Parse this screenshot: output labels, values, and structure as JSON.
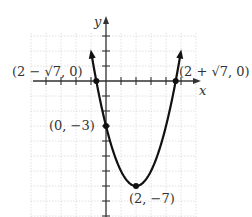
{
  "chart_data": {
    "type": "line",
    "title": "",
    "function": "y = x^2 - 4x - 3",
    "xlabel": "x",
    "ylabel": "y",
    "xlim": [
      -5,
      6
    ],
    "ylim": [
      -9,
      3
    ],
    "grid": true,
    "tick_spacing": 1,
    "series": [
      {
        "name": "parabola",
        "x": [
          -0.9,
          -0.646,
          0,
          1,
          2,
          3,
          4,
          4.646,
          4.9
        ],
        "values": [
          1.41,
          0,
          -3,
          -6,
          -7,
          -6,
          -3,
          0,
          1.41
        ]
      }
    ],
    "points": [
      {
        "label": "(2 − √7, 0)",
        "x": -0.646,
        "y": 0
      },
      {
        "label": "(2 + √7, 0)",
        "x": 4.646,
        "y": 0
      },
      {
        "label": "(0, −3)",
        "x": 0,
        "y": -3
      },
      {
        "label": "(2, −7)",
        "x": 2,
        "y": -7
      }
    ]
  },
  "labels": {
    "x_axis": "x",
    "y_axis": "y",
    "root_left": "(2 − √7, 0)",
    "root_right": "(2 + √7, 0)",
    "y_intercept": "(0, −3)",
    "vertex": "(2, −7)"
  }
}
